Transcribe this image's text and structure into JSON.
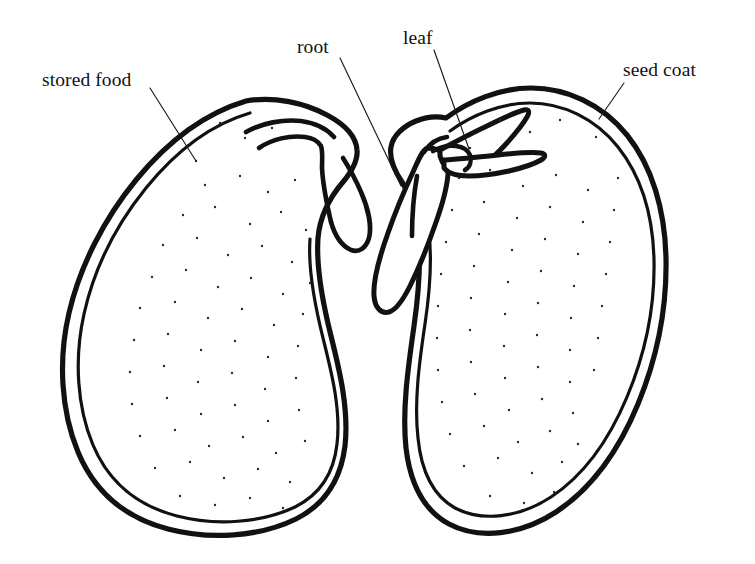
{
  "diagram": {
    "background_color": "#ffffff",
    "ink_color": "#111111",
    "stipple_color": "#2a2a2a",
    "width": 755,
    "height": 564
  },
  "labels": [
    {
      "key": "stored_food",
      "text": "stored food",
      "name": "label-stored-food",
      "x": 42,
      "y": 70,
      "leader": {
        "x1": 150,
        "y1": 88,
        "x2": 196,
        "y2": 161
      }
    },
    {
      "key": "root",
      "text": "root",
      "name": "label-root",
      "x": 297,
      "y": 37,
      "leader": {
        "x1": 340,
        "y1": 58,
        "x2": 401,
        "y2": 186
      }
    },
    {
      "key": "leaf",
      "text": "leaf",
      "name": "label-leaf",
      "x": 403,
      "y": 28,
      "leader": {
        "x1": 434,
        "y1": 50,
        "x2": 469,
        "y2": 149
      }
    },
    {
      "key": "seed_coat",
      "text": "seed coat",
      "name": "label-seed-coat",
      "x": 623,
      "y": 60,
      "leader": {
        "x1": 624,
        "y1": 83,
        "x2": 599,
        "y2": 119
      }
    }
  ],
  "parts": {
    "left_cotyledon": "left-cotyledon",
    "right_cotyledon": "right-cotyledon",
    "radicle": "radicle-root",
    "plumule": "plumule-leaves",
    "seed_coat_outer": "seed-coat-outer-line",
    "seed_coat_inner": "seed-coat-inner-line"
  }
}
